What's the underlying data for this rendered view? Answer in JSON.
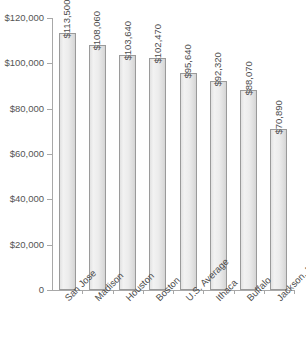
{
  "chart_data": {
    "type": "bar",
    "title": "",
    "subtitle": "",
    "xlabel": "",
    "ylabel": "",
    "categories": [
      "San Jose",
      "Madison",
      "Houston",
      "Boston",
      "U.S. Average",
      "Ithaca",
      "Buffalo",
      "Jackson, MS"
    ],
    "values": [
      113500,
      108060,
      103640,
      102470,
      95640,
      92320,
      88070,
      70890
    ],
    "value_labels": [
      "$113,500",
      "$108,060",
      "$103,640",
      "$102,470",
      "$95,640",
      "$92,320",
      "$88,070",
      "$70,890"
    ],
    "ylim": [
      0,
      120000
    ],
    "ytick_values": [
      0,
      20000,
      40000,
      60000,
      80000,
      100000,
      120000
    ],
    "ytick_labels": [
      "0",
      "$20,000",
      "$40,000",
      "$60,000",
      "$80,000",
      "$100,000",
      "$120,000"
    ],
    "grid": false,
    "legend": false,
    "legend_position": "none",
    "bar_fill_color": "#ececec",
    "bar_border_color": "#9a9a9a",
    "axis_color": "#a8a8a8",
    "text_color": "#4d4d4d",
    "background_color": "#ffffff"
  }
}
